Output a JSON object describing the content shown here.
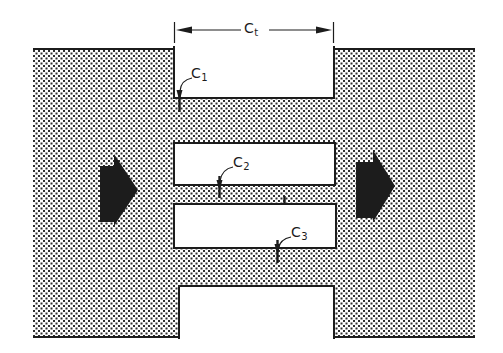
{
  "figure": {
    "kind": "crack-geometry-diagram",
    "labels": {
      "ct": {
        "base": "C",
        "sub": "t"
      },
      "c1": {
        "base": "C",
        "sub": "1"
      },
      "c2": {
        "base": "C",
        "sub": "2"
      },
      "c3": {
        "base": "C",
        "sub": "3"
      }
    },
    "icons": {
      "flow_arrow_left": "solid-right-block-arrow",
      "flow_arrow_right": "solid-right-block-arrow"
    },
    "colors": {
      "ink": "#1c1c1c",
      "stipple_dot": "#2e2e2e",
      "background": "#ffffff",
      "slot_fill": "#ffffff"
    }
  }
}
